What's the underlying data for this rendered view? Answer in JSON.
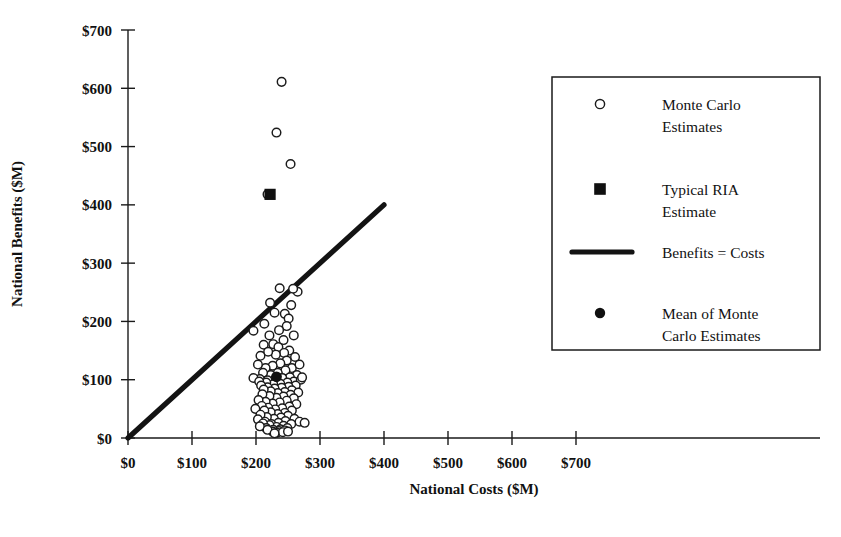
{
  "chart_data": {
    "type": "scatter",
    "title": "",
    "xlabel": "National Costs ($M)",
    "ylabel": "National Benefits ($M)",
    "xlim": [
      0,
      700
    ],
    "ylim": [
      0,
      700
    ],
    "xticks": [
      0,
      100,
      200,
      300,
      400,
      500,
      600,
      700
    ],
    "yticks": [
      0,
      100,
      200,
      300,
      400,
      500,
      600,
      700
    ],
    "xticklabels": [
      "$0",
      "$100",
      "$200",
      "$300",
      "$400",
      "$500",
      "$600",
      "$700"
    ],
    "yticklabels": [
      "$0",
      "$100",
      "$200",
      "$300",
      "$400",
      "$500",
      "$600",
      "$700"
    ],
    "grid": false,
    "legend_position": "right",
    "series": [
      {
        "name": "Monte Carlo Estimates",
        "marker": "open-circle",
        "color": "#ffffff",
        "edge_color": "#1b1b1b",
        "points": [
          [
            240,
            611
          ],
          [
            232,
            524
          ],
          [
            254,
            470
          ],
          [
            218,
            418
          ],
          [
            237,
            257
          ],
          [
            222,
            232
          ],
          [
            265,
            251
          ],
          [
            258,
            256
          ],
          [
            196,
            184
          ],
          [
            213,
            196
          ],
          [
            229,
            215
          ],
          [
            245,
            213
          ],
          [
            251,
            205
          ],
          [
            255,
            228
          ],
          [
            248,
            192
          ],
          [
            236,
            185
          ],
          [
            221,
            176
          ],
          [
            212,
            160
          ],
          [
            227,
            161
          ],
          [
            235,
            156
          ],
          [
            243,
            168
          ],
          [
            252,
            150
          ],
          [
            259,
            176
          ],
          [
            244,
            146
          ],
          [
            231,
            143
          ],
          [
            219,
            148
          ],
          [
            207,
            141
          ],
          [
            261,
            139
          ],
          [
            248,
            133
          ],
          [
            238,
            128
          ],
          [
            226,
            124
          ],
          [
            215,
            120
          ],
          [
            203,
            126
          ],
          [
            256,
            120
          ],
          [
            268,
            126
          ],
          [
            246,
            116
          ],
          [
            234,
            112
          ],
          [
            223,
            108
          ],
          [
            211,
            112
          ],
          [
            264,
            108
          ],
          [
            253,
            104
          ],
          [
            241,
            103
          ],
          [
            229,
            100
          ],
          [
            218,
            99
          ],
          [
            206,
            101
          ],
          [
            196,
            103
          ],
          [
            259,
            97
          ],
          [
            270,
            100
          ],
          [
            249,
            95
          ],
          [
            238,
            93
          ],
          [
            227,
            92
          ],
          [
            216,
            95
          ],
          [
            205,
            97
          ],
          [
            262,
            90
          ],
          [
            251,
            88
          ],
          [
            240,
            86
          ],
          [
            229,
            85
          ],
          [
            218,
            87
          ],
          [
            208,
            90
          ],
          [
            272,
            104
          ],
          [
            256,
            82
          ],
          [
            245,
            79
          ],
          [
            234,
            77
          ],
          [
            223,
            80
          ],
          [
            212,
            83
          ],
          [
            266,
            78
          ],
          [
            254,
            74
          ],
          [
            243,
            71
          ],
          [
            232,
            69
          ],
          [
            221,
            72
          ],
          [
            210,
            75
          ],
          [
            259,
            68
          ],
          [
            248,
            64
          ],
          [
            237,
            61
          ],
          [
            226,
            59
          ],
          [
            215,
            62
          ],
          [
            204,
            65
          ],
          [
            263,
            58
          ],
          [
            252,
            54
          ],
          [
            241,
            51
          ],
          [
            230,
            49
          ],
          [
            219,
            52
          ],
          [
            209,
            55
          ],
          [
            256,
            47
          ],
          [
            245,
            43
          ],
          [
            234,
            41
          ],
          [
            223,
            44
          ],
          [
            213,
            47
          ],
          [
            199,
            50
          ],
          [
            250,
            38
          ],
          [
            239,
            35
          ],
          [
            228,
            33
          ],
          [
            217,
            36
          ],
          [
            207,
            40
          ],
          [
            260,
            33
          ],
          [
            246,
            29
          ],
          [
            235,
            26
          ],
          [
            224,
            24
          ],
          [
            214,
            28
          ],
          [
            203,
            32
          ],
          [
            268,
            28
          ],
          [
            255,
            24
          ],
          [
            243,
            21
          ],
          [
            232,
            19
          ],
          [
            221,
            22
          ],
          [
            211,
            25
          ],
          [
            276,
            26
          ],
          [
            249,
            17
          ],
          [
            238,
            15
          ],
          [
            227,
            14
          ],
          [
            216,
            17
          ],
          [
            206,
            20
          ],
          [
            236,
            12
          ],
          [
            226,
            11
          ],
          [
            245,
            13
          ],
          [
            218,
            14
          ],
          [
            233,
            9
          ],
          [
            242,
            10
          ],
          [
            250,
            11
          ],
          [
            229,
            8
          ]
        ]
      }
    ],
    "markers": [
      {
        "name": "Typical RIA Estimate",
        "marker": "filled-square",
        "color": "#101010",
        "point": [
          222,
          418
        ]
      },
      {
        "name": "Mean of Monte Carlo Estimates",
        "marker": "filled-circle",
        "color": "#101010",
        "point": [
          232,
          105
        ]
      }
    ],
    "reference_line": {
      "name": "Benefits = Costs",
      "from": [
        0,
        0
      ],
      "to": [
        400,
        400
      ],
      "color": "#131313",
      "width": 5
    },
    "annotations": []
  },
  "legend": {
    "items": [
      {
        "label_line1": "Monte Carlo",
        "label_line2": "Estimates",
        "marker": "open-circle"
      },
      {
        "label_line1": "Typical RIA",
        "label_line2": "Estimate",
        "marker": "filled-square"
      },
      {
        "label_line1": "Benefits = Costs",
        "label_line2": "",
        "marker": "line"
      },
      {
        "label_line1": "Mean of Monte",
        "label_line2": "Carlo Estimates",
        "marker": "filled-circle"
      }
    ]
  },
  "axes": {
    "x_title": "National Costs ($M)",
    "y_title": "National Benefits ($M)",
    "x_labels": [
      "$0",
      "$100",
      "$200",
      "$300",
      "$400",
      "$500",
      "$600",
      "$700"
    ],
    "y_labels": [
      "$0",
      "$100",
      "$200",
      "$300",
      "$400",
      "$500",
      "$600",
      "$700"
    ]
  },
  "colors": {
    "ink": "#131313",
    "paper": "#ffffff"
  }
}
